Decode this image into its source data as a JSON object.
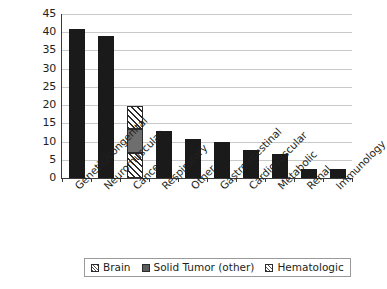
{
  "chart_data": {
    "type": "bar",
    "stacked": true,
    "title": "",
    "subtitle": "",
    "xlabel": "",
    "ylabel": "",
    "ylim": [
      0,
      45
    ],
    "ytick_step": 5,
    "yticks": [
      "45",
      "40",
      "35",
      "30",
      "25",
      "20",
      "15",
      "10",
      "5",
      "0"
    ],
    "grid": true,
    "legend_position": "bottom",
    "categories": [
      "Genetic/congenital",
      "Neuromuscular",
      "Cancer",
      "Respiratory",
      "Other",
      "Gastrointestinal",
      "Cardiovascular",
      "Metabolic",
      "Renal",
      "Immunology"
    ],
    "series": [
      {
        "name": "Brain",
        "pattern": "hatch",
        "values": [
          0,
          0,
          7.0,
          0,
          0,
          0,
          0,
          0,
          0,
          0
        ]
      },
      {
        "name": "Solid Tumor (other)",
        "pattern": "solid-gray",
        "values": [
          0,
          0,
          6.5,
          0,
          0,
          0,
          0,
          0,
          0,
          0
        ]
      },
      {
        "name": "Hematologic",
        "pattern": "hatch",
        "values": [
          0,
          0,
          6.2,
          0,
          0,
          0,
          0,
          0,
          0,
          0
        ]
      },
      {
        "name": "Other categories",
        "pattern": "solid-black",
        "values": [
          41.0,
          39.0,
          0,
          13.0,
          10.8,
          9.9,
          7.7,
          6.6,
          2.5,
          2.4
        ]
      }
    ],
    "totals": [
      41.0,
      39.0,
      19.7,
      13.0,
      10.8,
      9.9,
      7.7,
      6.6,
      2.5,
      2.4
    ]
  },
  "legend": {
    "entries": [
      {
        "label": "Brain",
        "swatch": "sw-brain"
      },
      {
        "label": "Solid Tumor (other)",
        "swatch": "sw-solid"
      },
      {
        "label": "Hematologic",
        "swatch": "sw-hema"
      }
    ]
  },
  "colors": {
    "bar_black": "#1a1a1a",
    "bar_gray": "#6e6e6e",
    "hatch_line": "#2b2b2b",
    "gridline": "#c9c9c9",
    "axis": "#3a3a3a",
    "text": "#231f20",
    "background": "#ffffff"
  }
}
